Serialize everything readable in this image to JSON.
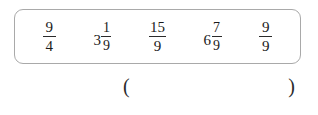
{
  "worksheet": {
    "expression_box": {
      "terms": [
        {
          "kind": "fraction",
          "whole": "",
          "numerator": "9",
          "denominator": "4",
          "text": "9/4"
        },
        {
          "kind": "mixed",
          "whole": "3",
          "numerator": "1",
          "denominator": "9",
          "text": "3 1/9"
        },
        {
          "kind": "fraction",
          "whole": "",
          "numerator": "15",
          "denominator": "9",
          "text": "15/9"
        },
        {
          "kind": "mixed",
          "whole": "6",
          "numerator": "7",
          "denominator": "9",
          "text": "6 7/9"
        },
        {
          "kind": "fraction",
          "whole": "",
          "numerator": "9",
          "denominator": "9",
          "text": "9/9"
        }
      ]
    },
    "answer": {
      "open_paren": "(",
      "close_paren": ")",
      "value": "",
      "placeholder": ""
    },
    "colors": {
      "border": "#a9a9a9",
      "text": "#1a1a1a",
      "background": "#ffffff"
    }
  }
}
